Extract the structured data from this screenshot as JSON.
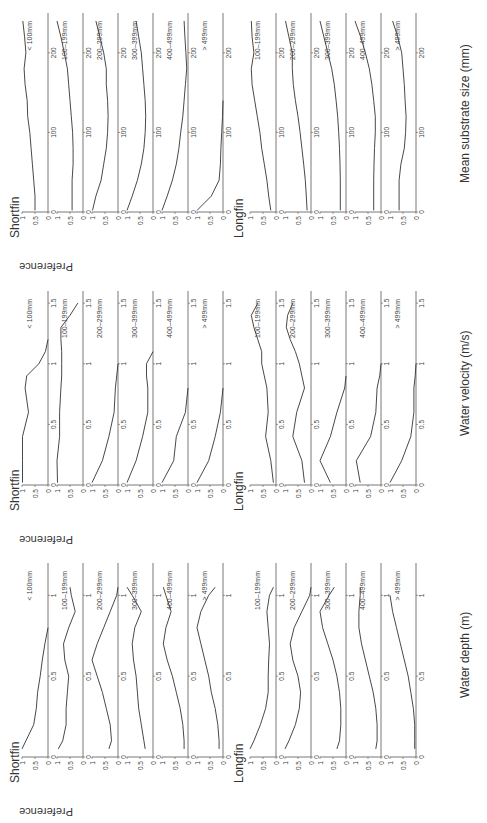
{
  "figure": {
    "y_label": "Preference",
    "species": [
      "Shortfin",
      "Longfin"
    ],
    "size_classes_labels": [
      "< 100mm",
      "100–199mm",
      "200–299mm",
      "300–399mm",
      "400–499mm",
      "> 499mm"
    ],
    "blocks": [
      {
        "id": "depth",
        "x_label": "Water depth (m)",
        "shortfin_title": "Shortfin",
        "longfin_title": "Longfin"
      },
      {
        "id": "velocity",
        "x_label": "Water velocity (m/s)",
        "shortfin_title": "Shortfin",
        "longfin_title": "Longfin"
      },
      {
        "id": "substrate",
        "x_label": "Mean substrate size (mm)",
        "shortfin_title": "Shortfin",
        "longfin_title": "Longfin"
      }
    ]
  },
  "chart_data": [
    {
      "type": "line",
      "title": "Shortfin – Water depth",
      "xlabel": "Water depth (m)",
      "ylabel": "Preference",
      "xlim": [
        0,
        1.2
      ],
      "ylim": [
        0,
        1
      ],
      "xticks": [
        0,
        0.5,
        1
      ],
      "yticks": [
        0,
        0.5,
        1
      ],
      "x": [
        0.05,
        0.1,
        0.2,
        0.3,
        0.4,
        0.5,
        0.6,
        0.7,
        0.8,
        0.9,
        1.0,
        1.05
      ],
      "series": [
        {
          "name": "< 100mm",
          "values": [
            1.0,
            0.85,
            0.55,
            0.45,
            0.4,
            0.3,
            0.22,
            0.12,
            0.0,
            null,
            null,
            null
          ]
        },
        {
          "name": "100–199mm",
          "values": [
            0.95,
            0.78,
            0.65,
            0.65,
            0.6,
            0.55,
            0.7,
            0.75,
            0.55,
            0.3,
            0.45,
            0.5
          ]
        },
        {
          "name": "200–299mm",
          "values": [
            0.35,
            0.25,
            0.3,
            0.45,
            0.6,
            0.8,
            1.0,
            0.8,
            0.55,
            0.3,
            0.05,
            0.0
          ]
        },
        {
          "name": "300–399mm",
          "values": [
            0.3,
            0.35,
            0.45,
            0.55,
            0.6,
            0.65,
            0.75,
            0.8,
            0.7,
            0.45,
            0.8,
            1.0
          ]
        },
        {
          "name": "400–499mm",
          "values": [
            0.15,
            0.15,
            0.2,
            0.3,
            0.45,
            0.6,
            0.8,
            0.95,
            0.85,
            0.65,
            0.85,
            0.95
          ]
        },
        {
          "name": "> 499mm",
          "values": [
            0.15,
            0.15,
            0.2,
            0.3,
            0.45,
            0.55,
            0.7,
            0.85,
            1.0,
            0.85,
            0.55,
            0.3
          ]
        }
      ]
    },
    {
      "type": "line",
      "title": "Longfin – Water depth",
      "xlabel": "Water depth (m)",
      "ylabel": "Preference",
      "xlim": [
        0,
        1.2
      ],
      "ylim": [
        0,
        1
      ],
      "xticks": [
        0,
        0.5,
        1
      ],
      "yticks": [
        0,
        0.5,
        1
      ],
      "x": [
        0.05,
        0.1,
        0.2,
        0.3,
        0.4,
        0.5,
        0.6,
        0.7,
        0.8,
        0.9,
        1.0,
        1.05
      ],
      "series": [
        {
          "name": "100–199mm",
          "values": [
            1.0,
            0.85,
            0.6,
            0.4,
            0.3,
            0.3,
            0.28,
            0.25,
            0.3,
            0.35,
            0.25,
            0.1
          ]
        },
        {
          "name": "200–299mm",
          "values": [
            1.0,
            0.85,
            0.6,
            0.45,
            0.4,
            0.5,
            0.7,
            0.8,
            0.65,
            0.35,
            0.05,
            0.0
          ]
        },
        {
          "name": "300–399mm",
          "values": [
            0.35,
            0.25,
            0.2,
            0.2,
            0.25,
            0.35,
            0.5,
            0.7,
            0.9,
            1.0,
            0.65,
            0.45
          ]
        },
        {
          "name": "400–499mm",
          "values": [
            0.2,
            0.15,
            0.15,
            0.2,
            0.3,
            0.45,
            0.6,
            0.75,
            0.85,
            0.85,
            0.8,
            0.8
          ]
        },
        {
          "name": "> 499mm",
          "values": [
            0.05,
            0.05,
            0.05,
            0.1,
            0.2,
            0.3,
            0.45,
            0.6,
            0.75,
            0.9,
            1.0,
            null
          ]
        }
      ]
    },
    {
      "type": "line",
      "title": "Shortfin – Water velocity",
      "xlabel": "Water velocity (m/s)",
      "ylabel": "Preference",
      "xlim": [
        0,
        1.6
      ],
      "ylim": [
        0,
        1
      ],
      "xticks": [
        0,
        0.5,
        1,
        1.5
      ],
      "yticks": [
        0,
        0.5,
        1
      ],
      "x": [
        0.02,
        0.2,
        0.4,
        0.6,
        0.8,
        0.9,
        1.0,
        1.1,
        1.2,
        1.3,
        1.4,
        1.5
      ],
      "series": [
        {
          "name": "< 100mm",
          "values": [
            0.98,
            0.98,
            0.98,
            0.75,
            0.88,
            0.82,
            0.35,
            0.1,
            0.0,
            null,
            null,
            null
          ]
        },
        {
          "name": "100–199mm",
          "values": [
            0.98,
            1.0,
            0.9,
            0.9,
            0.85,
            0.82,
            0.82,
            0.82,
            0.85,
            0.85,
            0.5,
            0.2
          ]
        },
        {
          "name": "200–299mm",
          "values": [
            1.0,
            0.6,
            0.35,
            0.15,
            0.1,
            0.05,
            0.0,
            null,
            null,
            null,
            null,
            null
          ]
        },
        {
          "name": "300–399mm",
          "values": [
            1.0,
            0.65,
            0.4,
            0.2,
            0.2,
            0.25,
            0.25,
            0.0,
            null,
            null,
            null,
            null
          ]
        },
        {
          "name": "400–499mm",
          "values": [
            1.0,
            0.55,
            0.45,
            0.1,
            0.0,
            null,
            null,
            null,
            null,
            null,
            null,
            null
          ]
        },
        {
          "name": "> 499mm",
          "values": [
            1.0,
            0.55,
            0.3,
            0.1,
            0.0,
            null,
            null,
            null,
            null,
            null,
            null,
            null
          ]
        }
      ]
    },
    {
      "type": "line",
      "title": "Longfin – Water velocity",
      "xlabel": "Water velocity (m/s)",
      "ylabel": "Preference",
      "xlim": [
        0,
        1.6
      ],
      "ylim": [
        0,
        1
      ],
      "xticks": [
        0,
        0.5,
        1,
        1.5
      ],
      "yticks": [
        0,
        0.5,
        1
      ],
      "x": [
        0.02,
        0.2,
        0.4,
        0.6,
        0.8,
        0.9,
        1.0,
        1.1,
        1.2,
        1.3,
        1.4,
        1.5
      ],
      "series": [
        {
          "name": "100–199mm",
          "values": [
            0.1,
            0.2,
            0.4,
            0.3,
            0.35,
            0.45,
            0.55,
            0.55,
            0.7,
            0.85,
            0.95,
            0.7
          ]
        },
        {
          "name": "200–299mm",
          "values": [
            0.25,
            0.35,
            0.7,
            0.55,
            0.25,
            0.35,
            0.45,
            0.6,
            0.8,
            0.95,
            0.9,
            0.7
          ]
        },
        {
          "name": "300–399mm",
          "values": [
            0.6,
            1.0,
            0.6,
            0.35,
            0.05,
            0.0,
            null,
            null,
            null,
            null,
            null,
            null
          ]
        },
        {
          "name": "400–499mm",
          "values": [
            0.8,
            0.95,
            0.4,
            0.2,
            0.15,
            0.05,
            0.0,
            null,
            null,
            null,
            null,
            null
          ]
        },
        {
          "name": "> 499mm",
          "values": [
            1.0,
            0.55,
            0.2,
            0.08,
            0.08,
            0.03,
            0.0,
            null,
            null,
            null,
            null,
            null
          ]
        }
      ]
    },
    {
      "type": "line",
      "title": "Shortfin – Mean substrate size",
      "xlabel": "Mean substrate size (mm)",
      "ylabel": "Preference",
      "xlim": [
        0,
        250
      ],
      "ylim": [
        0,
        1
      ],
      "xticks": [
        0,
        100,
        200
      ],
      "yticks": [
        0,
        0.5,
        1
      ],
      "x": [
        2,
        20,
        40,
        60,
        80,
        100,
        120,
        140,
        160,
        180,
        200,
        220,
        240
      ],
      "series": [
        {
          "name": "< 100mm",
          "values": [
            0.5,
            0.5,
            0.55,
            0.6,
            0.65,
            0.7,
            0.78,
            0.8,
            0.88,
            0.92,
            0.85,
            0.9,
            0.97
          ]
        },
        {
          "name": "100–199mm",
          "values": [
            0.42,
            0.42,
            0.42,
            0.38,
            0.38,
            0.4,
            0.45,
            0.5,
            0.55,
            0.6,
            0.72,
            0.85,
            1.0
          ]
        },
        {
          "name": "200–299mm",
          "values": [
            0.98,
            0.85,
            0.65,
            0.55,
            0.45,
            0.4,
            0.38,
            0.4,
            0.45,
            0.45,
            0.55,
            0.7,
            0.85
          ]
        },
        {
          "name": "300–399mm",
          "values": [
            1.0,
            0.8,
            0.6,
            0.45,
            0.35,
            0.3,
            0.28,
            0.3,
            0.35,
            0.4,
            0.45,
            0.55,
            0.65
          ]
        },
        {
          "name": "400–499mm",
          "values": [
            1.0,
            0.8,
            0.6,
            0.45,
            0.35,
            0.28,
            0.2,
            0.15,
            0.1,
            0.05,
            0.08,
            0.12,
            0.15
          ]
        },
        {
          "name": "> 499mm",
          "values": [
            1.0,
            0.45,
            0.15,
            0.1,
            0.08,
            0.05,
            0.02,
            0.0,
            null,
            null,
            null,
            null,
            null
          ]
        }
      ]
    },
    {
      "type": "line",
      "title": "Longfin – Mean substrate size",
      "xlabel": "Mean substrate size (mm)",
      "ylabel": "Preference",
      "xlim": [
        0,
        250
      ],
      "ylim": [
        0,
        1
      ],
      "xticks": [
        0,
        100,
        200
      ],
      "yticks": [
        0,
        0.5,
        1
      ],
      "x": [
        2,
        20,
        40,
        60,
        80,
        100,
        120,
        140,
        160,
        180,
        200,
        220,
        240
      ],
      "series": [
        {
          "name": "100–199mm",
          "values": [
            0.2,
            0.28,
            0.35,
            0.45,
            0.55,
            0.62,
            0.72,
            0.82,
            0.92,
            0.95,
            0.85,
            0.92,
            0.95
          ]
        },
        {
          "name": "200–299mm",
          "values": [
            0.15,
            0.18,
            0.22,
            0.28,
            0.35,
            0.42,
            0.5,
            0.6,
            0.68,
            0.72,
            0.72,
            0.85,
            0.98
          ]
        },
        {
          "name": "300–399mm",
          "values": [
            0.22,
            0.22,
            0.22,
            0.23,
            0.25,
            0.28,
            0.32,
            0.38,
            0.45,
            0.55,
            0.7,
            0.85,
            1.0
          ]
        },
        {
          "name": "400–499mm",
          "values": [
            0.28,
            0.28,
            0.28,
            0.27,
            0.25,
            0.22,
            0.22,
            0.28,
            0.35,
            0.45,
            0.6,
            0.78,
            1.0
          ]
        },
        {
          "name": "> 499mm",
          "values": [
            0.65,
            0.65,
            0.65,
            0.58,
            0.45,
            0.4,
            0.38,
            0.42,
            0.45,
            0.5,
            0.55,
            0.7,
            0.9
          ]
        }
      ]
    }
  ]
}
